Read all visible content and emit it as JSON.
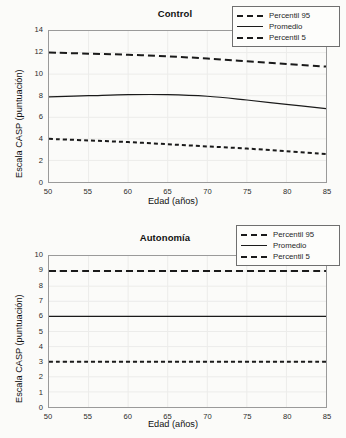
{
  "figure": {
    "background": "#fbfbf9",
    "line_color": "#1a1a1a",
    "axis_color": "#9a9a9a",
    "grid_color": "#ececea"
  },
  "legend": {
    "entries": [
      {
        "label": "Percentil 95",
        "style": "dashed-long"
      },
      {
        "label": "Promedio",
        "style": "solid"
      },
      {
        "label": "Percentil 5",
        "style": "dashed-short"
      }
    ]
  },
  "chart_data": [
    {
      "type": "line",
      "title": "Control",
      "xlabel": "Edad (años)",
      "ylabel": "Escala CASP (puntuación)",
      "xlim": [
        50,
        85
      ],
      "ylim": [
        0,
        14
      ],
      "xticks": [
        50,
        55,
        60,
        65,
        70,
        75,
        80,
        85
      ],
      "yticks": [
        0,
        2,
        4,
        6,
        8,
        10,
        12,
        14
      ],
      "grid": true,
      "legend_position": "top-right",
      "x": [
        50,
        55,
        60,
        65,
        70,
        75,
        80,
        85
      ],
      "series": [
        {
          "name": "Percentil 95",
          "style": "dashed-long",
          "values": [
            12.0,
            11.9,
            11.8,
            11.65,
            11.45,
            11.2,
            10.95,
            10.7
          ]
        },
        {
          "name": "Promedio",
          "style": "solid",
          "values": [
            7.9,
            8.0,
            8.1,
            8.1,
            7.95,
            7.6,
            7.2,
            6.8
          ]
        },
        {
          "name": "Percentil 5",
          "style": "dashed-short",
          "values": [
            4.0,
            3.85,
            3.7,
            3.5,
            3.3,
            3.1,
            2.85,
            2.6
          ]
        }
      ]
    },
    {
      "type": "line",
      "title": "Autonomía",
      "xlabel": "Edad (años)",
      "ylabel": "Escala CASP (puntuación)",
      "xlim": [
        50,
        85
      ],
      "ylim": [
        0,
        10
      ],
      "xticks": [
        50,
        55,
        60,
        65,
        70,
        75,
        80,
        85
      ],
      "yticks": [
        0,
        1,
        2,
        3,
        4,
        5,
        6,
        7,
        8,
        9,
        10
      ],
      "grid": true,
      "legend_position": "top-right",
      "x": [
        50,
        55,
        60,
        65,
        70,
        75,
        80,
        85
      ],
      "series": [
        {
          "name": "Percentil 95",
          "style": "dashed-long",
          "values": [
            9.0,
            9.0,
            9.0,
            9.0,
            9.0,
            9.0,
            9.0,
            9.0
          ]
        },
        {
          "name": "Promedio",
          "style": "solid",
          "values": [
            6.0,
            6.0,
            6.0,
            6.0,
            6.0,
            6.0,
            6.0,
            6.0
          ]
        },
        {
          "name": "Percentil 5",
          "style": "dashed-short",
          "values": [
            3.0,
            3.0,
            3.0,
            3.0,
            3.0,
            3.0,
            3.0,
            3.0
          ]
        }
      ]
    }
  ]
}
